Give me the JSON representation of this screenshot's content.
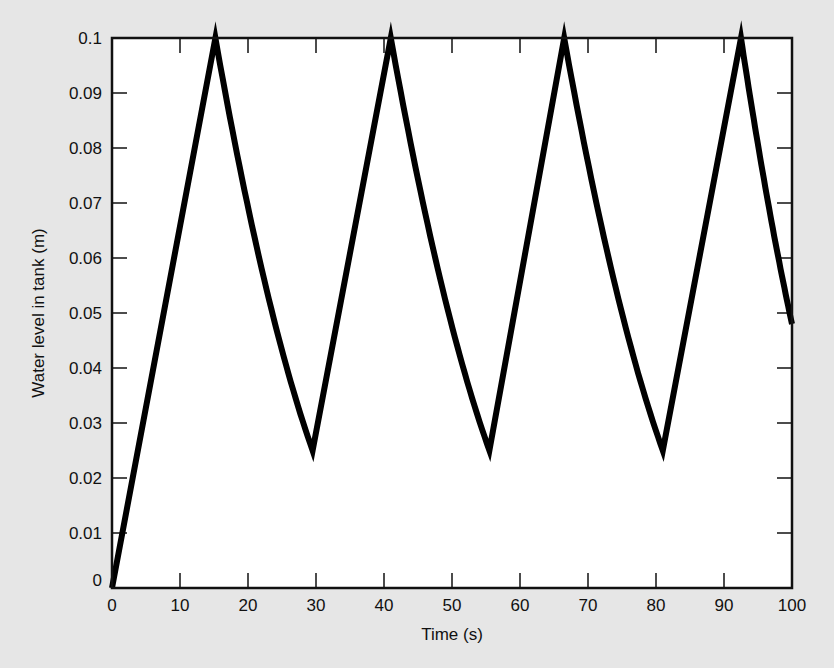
{
  "chart_data": {
    "type": "line",
    "title": "",
    "xlabel": "Time (s)",
    "ylabel": "Water level in tank (m)",
    "xlim": [
      0,
      100
    ],
    "ylim": [
      0,
      0.1
    ],
    "grid": false,
    "legend": null,
    "xticks": [
      0,
      10,
      20,
      30,
      40,
      50,
      60,
      70,
      80,
      90,
      100
    ],
    "xtick_labels": [
      "0",
      "10",
      "20",
      "30",
      "40",
      "50",
      "60",
      "70",
      "80",
      "90",
      "100"
    ],
    "yticks": [
      0,
      0.01,
      0.02,
      0.03,
      0.04,
      0.05,
      0.06,
      0.07,
      0.08,
      0.09,
      0.1
    ],
    "ytick_labels": [
      "0",
      "0.01",
      "0.02",
      "0.03",
      "0.04",
      "0.05",
      "0.06",
      "0.07",
      "0.08",
      "0.09",
      "0.1"
    ],
    "series": [
      {
        "name": "Water level",
        "color": "#000000",
        "segments": [
          {
            "kind": "fill-linear",
            "t_start": 0,
            "t_end": 15.2,
            "h_start": 0.0,
            "h_end": 0.1
          },
          {
            "kind": "drain",
            "t_start": 15.2,
            "t_end": 29.5,
            "h_start": 0.1,
            "h_end": 0.025
          },
          {
            "kind": "fill-linear",
            "t_start": 29.5,
            "t_end": 41.0,
            "h_start": 0.025,
            "h_end": 0.1
          },
          {
            "kind": "drain",
            "t_start": 41.0,
            "t_end": 55.5,
            "h_start": 0.1,
            "h_end": 0.025
          },
          {
            "kind": "fill-linear",
            "t_start": 55.5,
            "t_end": 66.5,
            "h_start": 0.025,
            "h_end": 0.1
          },
          {
            "kind": "drain",
            "t_start": 66.5,
            "t_end": 81.0,
            "h_start": 0.1,
            "h_end": 0.025
          },
          {
            "kind": "fill-linear",
            "t_start": 81.0,
            "t_end": 92.5,
            "h_start": 0.025,
            "h_end": 0.1
          },
          {
            "kind": "drain",
            "t_start": 92.5,
            "t_end": 100.0,
            "h_start": 0.1,
            "h_end": 0.048
          }
        ],
        "key_points": {
          "x": [
            0,
            15.2,
            29.5,
            41.0,
            55.5,
            66.5,
            81.0,
            92.5,
            100
          ],
          "y": [
            0.0,
            0.1,
            0.025,
            0.1,
            0.025,
            0.1,
            0.025,
            0.1,
            0.048
          ]
        }
      }
    ]
  }
}
